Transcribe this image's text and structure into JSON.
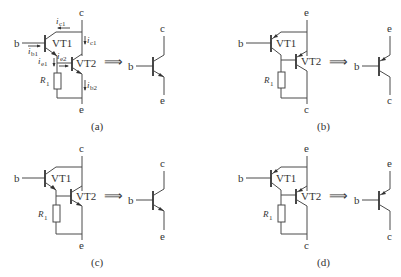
{
  "panels": [
    {
      "id": "a",
      "caption": "(a)",
      "type": "NPN-NPN Darlington",
      "terminals": {
        "top": "c",
        "left": "b",
        "bottom": "e"
      },
      "transistors": [
        "VT1",
        "VT2"
      ],
      "resistor": {
        "name": "R",
        "sub": "1"
      },
      "currents": [
        {
          "name": "i",
          "sub": "c1",
          "position": "top"
        },
        {
          "name": "i",
          "sub": "c1",
          "position": "right"
        },
        {
          "name": "i",
          "sub": "b1",
          "position": "base"
        },
        {
          "name": "i",
          "sub": "e1",
          "position": "emitter1"
        },
        {
          "name": "i",
          "sub": "e2",
          "position": "base2"
        },
        {
          "name": "i",
          "sub": "b2",
          "position": "output"
        }
      ],
      "arrow": "⟹",
      "equivalent": {
        "type": "NPN",
        "base": "b",
        "top": "c",
        "bottom": "e"
      }
    },
    {
      "id": "b",
      "caption": "(b)",
      "type": "PNP-PNP Darlington",
      "terminals": {
        "top": "e",
        "left": "b",
        "bottom": "c"
      },
      "transistors": [
        "VT1",
        "VT2"
      ],
      "resistor": {
        "name": "R",
        "sub": "1"
      },
      "arrow": "⟹",
      "equivalent": {
        "type": "PNP",
        "base": "b",
        "top": "e",
        "bottom": "c"
      }
    },
    {
      "id": "c",
      "caption": "(c)",
      "type": "NPN-NPN Darlington",
      "terminals": {
        "top": "c",
        "left": "b",
        "bottom": "e"
      },
      "transistors": [
        "VT1",
        "VT2"
      ],
      "resistor": {
        "name": "R",
        "sub": "1"
      },
      "arrow": "⟹",
      "equivalent": {
        "type": "NPN",
        "base": "b",
        "top": "c",
        "bottom": "e"
      }
    },
    {
      "id": "d",
      "caption": "(d)",
      "type": "PNP-PNP Darlington",
      "terminals": {
        "top": "e",
        "left": "b",
        "bottom": "c"
      },
      "transistors": [
        "VT1",
        "VT2"
      ],
      "resistor": {
        "name": "R",
        "sub": "1"
      },
      "arrow": "⟹",
      "equivalent": {
        "type": "PNP",
        "base": "b",
        "top": "e",
        "bottom": "c"
      }
    }
  ]
}
